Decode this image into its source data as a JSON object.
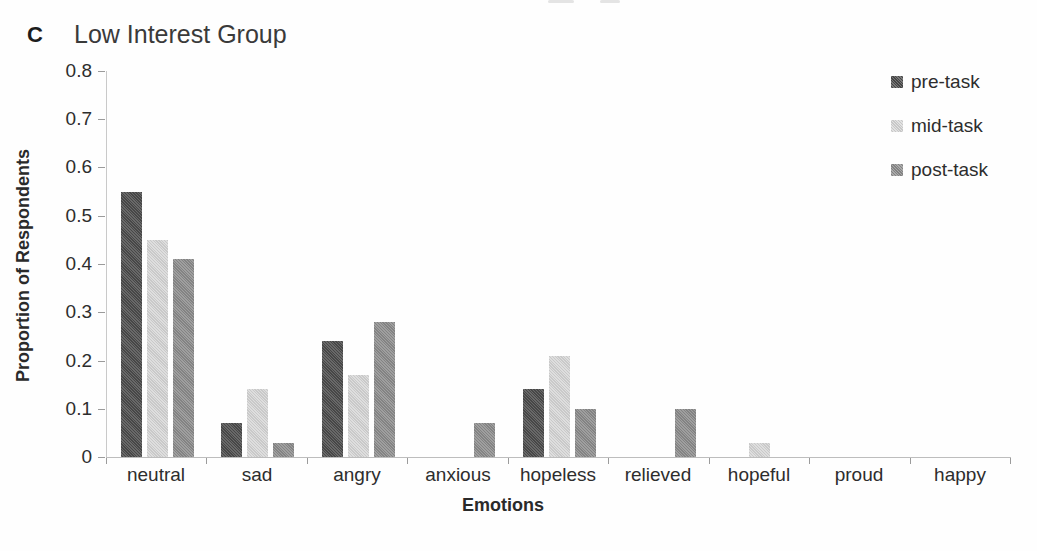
{
  "panel": {
    "letter": "C"
  },
  "colors": {
    "pre_task": "#4c4c4c",
    "mid_task": "#d8d8d8",
    "post_task": "#8d8d8d",
    "axis_line": "#c4c4c4",
    "tick_mark": "#9b9b9b",
    "text": "#2d2d2d"
  },
  "chart_data": {
    "type": "bar",
    "panel_label": "C",
    "title": "Low Interest Group",
    "xlabel": "Emotions",
    "ylabel": "Proportion of Respondents",
    "categories": [
      "neutral",
      "sad",
      "angry",
      "anxious",
      "hopeless",
      "relieved",
      "hopeful",
      "proud",
      "happy"
    ],
    "series": [
      {
        "name": "pre-task",
        "color": "#4c4c4c",
        "values": [
          0.55,
          0.07,
          0.24,
          0,
          0.14,
          0,
          0,
          0,
          0
        ]
      },
      {
        "name": "mid-task",
        "color": "#d8d8d8",
        "values": [
          0.45,
          0.14,
          0.17,
          0,
          0.21,
          0,
          0.03,
          0,
          0
        ]
      },
      {
        "name": "post-task",
        "color": "#8d8d8d",
        "values": [
          0.41,
          0.03,
          0.28,
          0.07,
          0.1,
          0.1,
          0,
          0,
          0
        ]
      }
    ],
    "ylim": [
      0,
      0.8
    ],
    "ytick_step": 0.1,
    "yticks": [
      "0",
      "0.1",
      "0.2",
      "0.3",
      "0.4",
      "0.5",
      "0.6",
      "0.7",
      "0.8"
    ],
    "grid": false,
    "legend_position": "top-right"
  }
}
